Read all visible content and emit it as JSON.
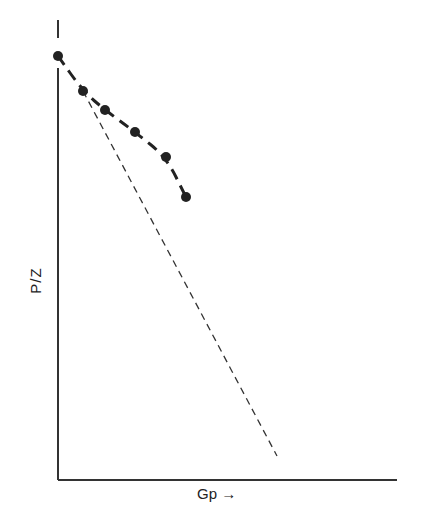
{
  "chart_data": {
    "type": "line",
    "title": "",
    "xlabel": "Gp →",
    "ylabel": "P/Z",
    "grid": false,
    "legend": null,
    "series": [
      {
        "name": "measured P/Z",
        "style": "dashed line with filled markers",
        "points_px": [
          [
            58,
            56
          ],
          [
            83,
            91
          ],
          [
            105,
            110
          ],
          [
            135,
            132
          ],
          [
            166,
            157
          ],
          [
            186,
            197
          ]
        ],
        "x": [
          0,
          0.07,
          0.14,
          0.23,
          0.32,
          0.38
        ],
        "y": [
          1.0,
          0.92,
          0.88,
          0.83,
          0.77,
          0.68
        ]
      },
      {
        "name": "extrapolated straight line",
        "style": "thin dashed line",
        "points_px": [
          [
            83,
            91
          ],
          [
            277,
            456
          ]
        ],
        "x": [
          0.07,
          0.65
        ],
        "y": [
          0.92,
          0.06
        ]
      }
    ],
    "axis_ranges": {
      "x": [
        0,
        1
      ],
      "y": [
        0,
        1
      ]
    },
    "ticks": "none"
  },
  "labels": {
    "x": "Gp →",
    "y": "P/Z"
  }
}
